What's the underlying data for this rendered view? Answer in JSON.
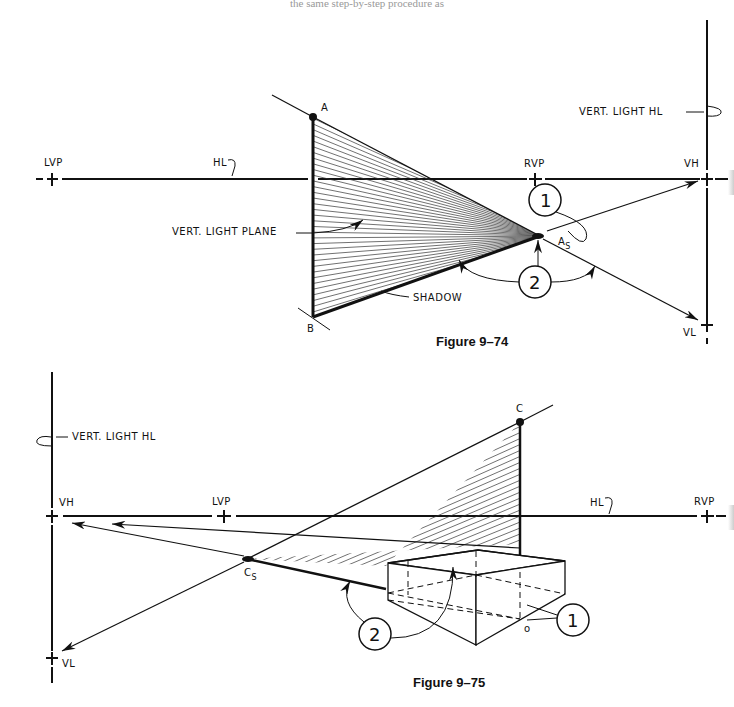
{
  "page": {
    "header_text": "the same step-by-step procedure as"
  },
  "figure_74": {
    "caption": "Figure 9–74",
    "labels": {
      "lvp": "LVP",
      "hl": "HL",
      "rvp": "RVP",
      "vh": "VH",
      "vl": "VL",
      "vert_light_hl": "VERT. LIGHT HL",
      "vert_light_plane": "VERT. LIGHT PLANE",
      "shadow": "SHADOW",
      "point_a": "A",
      "point_b": "B",
      "point_as": "A",
      "point_as_sub": "S"
    },
    "callouts": [
      "1",
      "2"
    ]
  },
  "figure_75": {
    "caption": "Figure 9–75",
    "labels": {
      "vh": "VH",
      "lvp": "LVP",
      "hl": "HL",
      "rvp": "RVP",
      "vl": "VL",
      "vert_light_hl": "VERT. LIGHT HL",
      "point_c": "C",
      "point_d": "D",
      "point_o": "o",
      "point_cs": "C",
      "point_cs_sub": "S"
    },
    "callouts": [
      "1",
      "2"
    ]
  },
  "colors": {
    "ink": "#111111",
    "paper": "#ffffff"
  }
}
